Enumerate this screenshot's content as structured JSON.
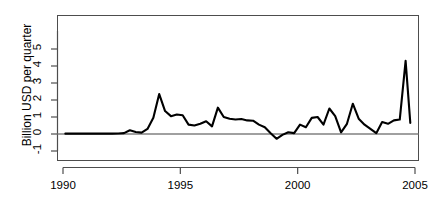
{
  "chart_data": {
    "type": "line",
    "title": "",
    "subtitle": "",
    "xlabel": "",
    "ylabel": "Billion USD per quarter",
    "xlim": [
      1990.0,
      2004.9
    ],
    "ylim": [
      -1.35,
      5.6
    ],
    "grid": false,
    "legend": null,
    "xticks": [
      1990,
      1995,
      2000,
      2005
    ],
    "xtick_labels": [
      "1990",
      "1995",
      "2000",
      "2005"
    ],
    "yticks": [
      -1,
      0,
      1,
      2,
      3,
      4,
      5
    ],
    "ytick_labels": [
      "-1",
      "0",
      "1",
      "2",
      "3",
      "4",
      "5"
    ],
    "zero_line": 0,
    "line_color": "#000000",
    "line_width": 2.1,
    "axis_color": "#4d4d4d",
    "zero_line_color": "#808080",
    "series": [
      {
        "name": "Billion USD per quarter",
        "x": [
          1990.1,
          1990.35,
          1990.6,
          1990.85,
          1991.1,
          1991.35,
          1991.6,
          1991.85,
          1992.1,
          1992.35,
          1992.6,
          1992.85,
          1993.1,
          1993.35,
          1993.6,
          1993.85,
          1994.1,
          1994.35,
          1994.6,
          1994.85,
          1995.1,
          1995.35,
          1995.6,
          1995.85,
          1996.1,
          1996.35,
          1996.6,
          1996.85,
          1997.1,
          1997.35,
          1997.6,
          1997.85,
          1998.1,
          1998.35,
          1998.6,
          1998.85,
          1999.1,
          1999.35,
          1999.6,
          1999.85,
          2000.1,
          2000.35,
          2000.6,
          2000.85,
          2001.1,
          2001.35,
          2001.6,
          2001.85,
          2002.1,
          2002.35,
          2002.6,
          2002.85,
          2003.1,
          2003.35,
          2003.6,
          2003.85,
          2004.1,
          2004.35,
          2004.6,
          2004.8
        ],
        "y": [
          0.02,
          0.02,
          0.02,
          0.02,
          0.02,
          0.02,
          0.02,
          0.02,
          0.02,
          0.03,
          0.05,
          0.22,
          0.12,
          0.08,
          0.3,
          0.95,
          2.35,
          1.35,
          1.05,
          1.15,
          1.1,
          0.55,
          0.5,
          0.6,
          0.75,
          0.45,
          1.55,
          1.0,
          0.9,
          0.85,
          0.88,
          0.8,
          0.78,
          0.55,
          0.4,
          0.05,
          -0.28,
          -0.05,
          0.1,
          0.05,
          0.55,
          0.4,
          0.95,
          1.0,
          0.55,
          1.5,
          1.05,
          0.1,
          0.6,
          1.78,
          0.9,
          0.55,
          0.3,
          0.05,
          0.7,
          0.6,
          0.8,
          0.85,
          4.3,
          0.65
        ]
      }
    ],
    "annotations": []
  },
  "axis": {
    "y_title": "Billion USD per quarter"
  }
}
